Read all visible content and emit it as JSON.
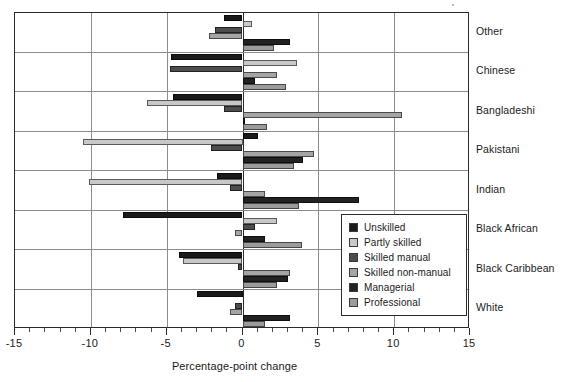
{
  "chart_data": {
    "type": "bar",
    "orientation": "horizontal",
    "title": "",
    "xlabel": "Percentage-point change",
    "ylabel": "",
    "xlim": [
      -15,
      15
    ],
    "xticks": [
      -15,
      -10,
      -5,
      0,
      5,
      10,
      15
    ],
    "xtick_labels": [
      "-15",
      "-10",
      "-5",
      "0",
      "5",
      "10",
      "15"
    ],
    "minor_tick_step": 1,
    "grid": "vertical gridlines at major x ticks; horizontal separators between ethnic groups",
    "legend_position": "inside lower-right of plot area",
    "categories": [
      "Other",
      "Chinese",
      "Bangladeshi",
      "Pakistani",
      "Indian",
      "Black African",
      "Black Caribbean",
      "White"
    ],
    "series": [
      {
        "name": "Unskilled",
        "color": "#1a1a1a",
        "values": [
          -1.2,
          -4.7,
          -4.6,
          1.0,
          -1.7,
          -7.9,
          -4.2,
          -3.0
        ]
      },
      {
        "name": "Partly skilled",
        "color": "#c8c8c8",
        "values": [
          0.6,
          3.6,
          -6.3,
          -10.5,
          -10.1,
          2.3,
          -3.9,
          0.0
        ]
      },
      {
        "name": "Skilled manual",
        "color": "#4d4d4d",
        "values": [
          -1.8,
          -4.8,
          -1.2,
          -2.1,
          -0.8,
          0.8,
          -0.3,
          -0.5
        ]
      },
      {
        "name": "Skilled non-manual",
        "color": "#a5a5a5",
        "values": [
          -2.2,
          2.3,
          10.5,
          4.7,
          1.5,
          -0.5,
          3.1,
          -0.85
        ]
      },
      {
        "name": "Managerial",
        "color": "#222222",
        "values": [
          3.1,
          0.8,
          0.1,
          4.0,
          7.7,
          1.5,
          3.0,
          3.1
        ]
      },
      {
        "name": "Professional",
        "color": "#9b9b9b",
        "values": [
          2.1,
          2.9,
          1.6,
          3.4,
          3.7,
          3.9,
          2.3,
          1.5
        ]
      }
    ]
  },
  "legend": {
    "items": [
      {
        "label": "Unskilled",
        "color": "#1a1a1a"
      },
      {
        "label": "Partly skilled",
        "color": "#c8c8c8"
      },
      {
        "label": "Skilled manual",
        "color": "#4d4d4d"
      },
      {
        "label": "Skilled non-manual",
        "color": "#a5a5a5"
      },
      {
        "label": "Managerial",
        "color": "#222222"
      },
      {
        "label": "Professional",
        "color": "#9b9b9b"
      }
    ]
  },
  "axis": {
    "x_title": "Percentage-point change"
  }
}
